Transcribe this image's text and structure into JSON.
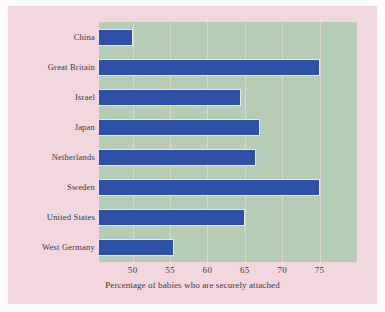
{
  "figure": {
    "background_color": "#f2d7de",
    "plot_background_color": "#b7ccb5",
    "bar_color": "#2f50a8",
    "gridline_color": "#dcd9c4"
  },
  "chart_data": {
    "type": "bar",
    "orientation": "horizontal",
    "title": "",
    "subtitle": "",
    "xlabel": "Percentage of babies who are securely attached",
    "ylabel": "",
    "categories": [
      "China",
      "Great Britain",
      "Israel",
      "Japan",
      "Netherlands",
      "Sweden",
      "United States",
      "West Germany"
    ],
    "values": [
      50,
      75,
      64.5,
      67,
      66.5,
      75,
      65,
      55.5
    ],
    "xticks": [
      50,
      55,
      60,
      65,
      70,
      75
    ],
    "xtick_labels": [
      "50",
      "55",
      "60",
      "65",
      "70",
      "75"
    ],
    "xlim": [
      45.5,
      80
    ],
    "grid": true,
    "grid_axis": "x",
    "legend": false,
    "legend_position": "none"
  }
}
